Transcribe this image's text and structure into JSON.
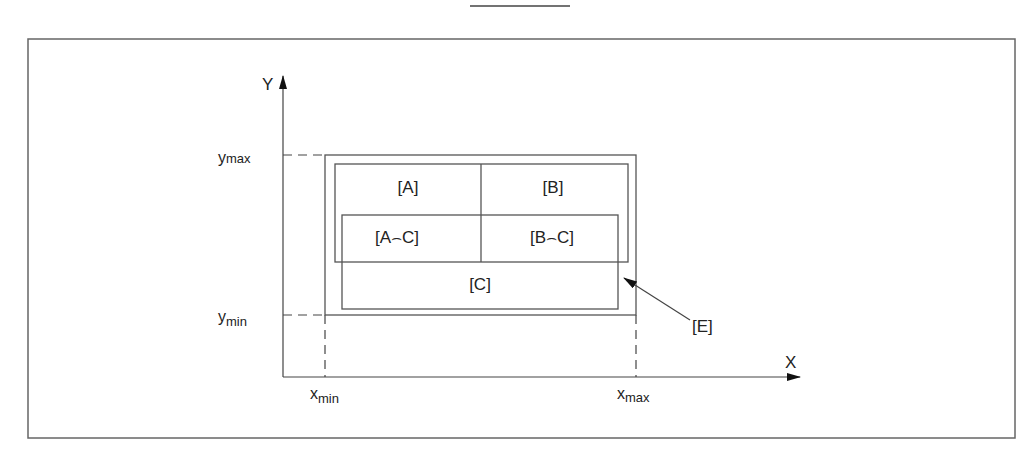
{
  "diagram": {
    "type": "region-intersection-schematic",
    "axes": {
      "x_label": "X",
      "y_label": "Y",
      "x_min_label": {
        "base": "x",
        "sub": "min"
      },
      "x_max_label": {
        "base": "x",
        "sub": "max"
      },
      "y_min_label": {
        "base": "y",
        "sub": "min"
      },
      "y_max_label": {
        "base": "y",
        "sub": "max"
      }
    },
    "regions": [
      {
        "id": "A",
        "label": "[A]"
      },
      {
        "id": "B",
        "label": "[B]"
      },
      {
        "id": "AC",
        "label": "[A⌢C]"
      },
      {
        "id": "BC",
        "label": "[B⌢C]"
      },
      {
        "id": "C",
        "label": "[C]"
      }
    ],
    "callout": {
      "label": "[E]",
      "target": "outer bounding rectangle"
    },
    "colors": {
      "line": "#555555",
      "text": "#222222",
      "frame": "#666666"
    }
  }
}
